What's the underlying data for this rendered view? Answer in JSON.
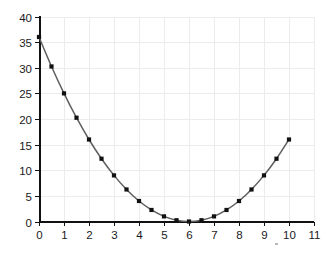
{
  "chart_data": {
    "type": "line",
    "title": "",
    "subtitle": "",
    "xlabel": "",
    "ylabel": "",
    "xlim": [
      0,
      11
    ],
    "ylim": [
      0,
      40
    ],
    "x_ticks": [
      0,
      1,
      2,
      3,
      4,
      5,
      6,
      7,
      8,
      9,
      10,
      11
    ],
    "y_ticks": [
      0,
      5,
      10,
      15,
      20,
      25,
      30,
      35,
      40
    ],
    "x_tick_labels": [
      "0",
      "1",
      "2",
      "3",
      "4",
      "5",
      "6",
      "7",
      "8",
      "9",
      "10",
      "11"
    ],
    "y_tick_labels": [
      "0",
      "5",
      "10",
      "15",
      "20",
      "25",
      "30",
      "35",
      "40"
    ],
    "grid": true,
    "grid_color": "#ececec",
    "legend": null,
    "legend_position": "none",
    "annotations": [],
    "marker": "square",
    "marker_color": "#111111",
    "line_color": "#5f5f5f",
    "series": [
      {
        "name": "y = (x - 6)^2",
        "x": [
          0,
          0.5,
          1,
          1.5,
          2,
          2.5,
          3,
          3.5,
          4,
          4.5,
          5,
          5.5,
          6,
          6.5,
          7,
          7.5,
          8,
          8.5,
          9,
          9.5,
          10
        ],
        "values": [
          36,
          30.25,
          25,
          20.25,
          16,
          12.25,
          9,
          6.25,
          4,
          2.25,
          1,
          0.25,
          0,
          0.25,
          1,
          2.25,
          4,
          6.25,
          9,
          12.25,
          16
        ]
      }
    ]
  },
  "artifacts": {
    "speck_label": "speck"
  }
}
